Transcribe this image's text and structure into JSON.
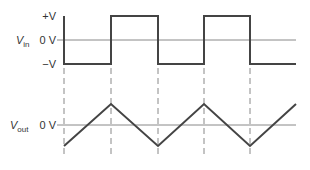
{
  "input": {
    "label_main": "V",
    "label_sub": "in",
    "levels": {
      "plus": "+V",
      "zero": "0 V",
      "minus": "−V"
    }
  },
  "output": {
    "label_main": "V",
    "label_sub": "out",
    "levels": {
      "zero": "0 V"
    }
  },
  "colors": {
    "trace": "#444444",
    "axis": "#888888",
    "dash": "#888888"
  }
}
